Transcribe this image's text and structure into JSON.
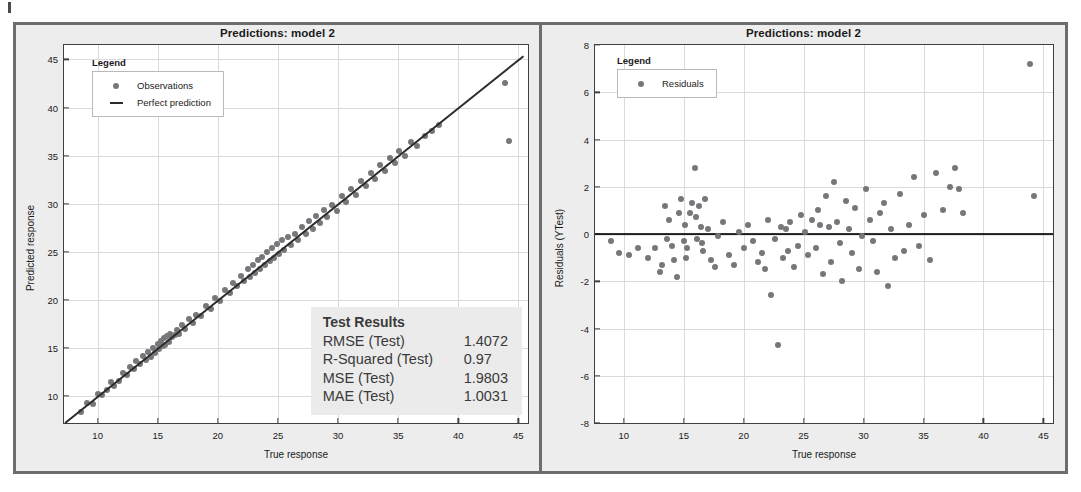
{
  "figure": {
    "left_panel": {
      "title": "Predictions: model 2",
      "xlabel": "True response",
      "ylabel": "Predicted response",
      "legend_title": "Legend",
      "legend_items": [
        {
          "label": "Observations",
          "marker": "dot"
        },
        {
          "label": "Perfect prediction",
          "marker": "line"
        }
      ],
      "results": {
        "title": "Test Results",
        "rows": [
          {
            "key": "RMSE (Test)",
            "value": "1.4072"
          },
          {
            "key": "R-Squared (Test)",
            "value": "0.97"
          },
          {
            "key": "MSE (Test)",
            "value": "1.9803"
          },
          {
            "key": "MAE (Test)",
            "value": "1.0031"
          }
        ]
      }
    },
    "right_panel": {
      "title": "Predictions: model 2",
      "xlabel": "True response",
      "ylabel": "Residuals (YTest)",
      "legend_title": "Legend",
      "legend_items": [
        {
          "label": "Residuals",
          "marker": "dot"
        }
      ]
    },
    "colors": {
      "marker": "#77777b",
      "reference_line": "#2b2b2b",
      "frame": "#6d6d6d",
      "panel_background": "#ededed",
      "plot_background": "#ffffff",
      "grid": "#dadada",
      "results_background": "#ebebeb"
    }
  },
  "chart_data": [
    {
      "type": "scatter",
      "title": "Predictions: model 2",
      "xlabel": "True response",
      "ylabel": "Predicted response",
      "xlim": [
        7.2,
        45.8
      ],
      "ylim": [
        7.2,
        46.5
      ],
      "xticks": [
        10,
        15,
        20,
        25,
        30,
        35,
        40,
        45
      ],
      "yticks": [
        10,
        15,
        20,
        25,
        30,
        35,
        40,
        45
      ],
      "grid": true,
      "legend_position": "top-left",
      "series": [
        {
          "name": "Observations",
          "marker": "circle",
          "color": "#77777b",
          "x": [
            8.6,
            9.1,
            9.6,
            10.0,
            10.4,
            10.8,
            11.1,
            11.4,
            11.8,
            12.1,
            12.4,
            12.7,
            13.0,
            13.2,
            13.5,
            13.8,
            14.0,
            14.2,
            14.4,
            14.6,
            14.8,
            15.0,
            15.1,
            15.3,
            15.4,
            15.5,
            15.6,
            15.8,
            15.9,
            16.0,
            16.2,
            16.4,
            16.6,
            16.8,
            17.0,
            17.3,
            17.6,
            17.9,
            18.2,
            18.6,
            19.0,
            19.4,
            19.8,
            20.2,
            20.6,
            21.0,
            21.3,
            21.6,
            21.9,
            22.2,
            22.5,
            22.7,
            22.9,
            23.1,
            23.3,
            23.5,
            23.7,
            23.9,
            24.1,
            24.3,
            24.5,
            24.7,
            24.9,
            25.1,
            25.3,
            25.5,
            25.8,
            26.1,
            26.4,
            26.7,
            27.0,
            27.3,
            27.6,
            27.9,
            28.2,
            28.5,
            28.8,
            29.1,
            29.5,
            29.9,
            30.3,
            30.7,
            31.1,
            31.5,
            31.9,
            32.3,
            32.7,
            33.1,
            33.5,
            33.9,
            34.3,
            34.7,
            35.1,
            35.6,
            36.1,
            36.6,
            37.2,
            37.8,
            38.4,
            43.9,
            44.2
          ],
          "y": [
            8.3,
            9.3,
            9.2,
            10.2,
            10.1,
            10.6,
            11.5,
            11.0,
            11.6,
            12.4,
            12.2,
            13.0,
            12.8,
            13.6,
            13.3,
            14.2,
            13.7,
            14.6,
            14.1,
            15.0,
            14.5,
            15.4,
            14.9,
            15.7,
            15.2,
            16.0,
            15.3,
            16.2,
            15.6,
            16.5,
            16.1,
            16.3,
            16.9,
            16.5,
            17.4,
            17.0,
            18.0,
            17.6,
            18.4,
            18.3,
            19.4,
            19.1,
            20.2,
            19.9,
            21.0,
            20.7,
            21.8,
            21.4,
            22.5,
            22.0,
            23.2,
            22.4,
            23.6,
            22.8,
            24.1,
            23.2,
            24.5,
            23.6,
            25.0,
            24.0,
            25.4,
            24.4,
            25.8,
            24.8,
            26.2,
            25.2,
            26.5,
            25.7,
            26.9,
            26.2,
            27.6,
            26.8,
            28.2,
            27.4,
            28.7,
            28.0,
            29.3,
            28.6,
            29.9,
            29.2,
            30.8,
            30.2,
            31.5,
            30.9,
            32.4,
            31.8,
            33.2,
            32.6,
            34.0,
            33.4,
            34.8,
            34.2,
            35.5,
            35.0,
            36.4,
            36.0,
            37.0,
            37.6,
            38.2,
            42.5,
            36.5
          ]
        },
        {
          "name": "Perfect prediction",
          "marker": "line",
          "color": "#2b2b2b",
          "x": [
            7.3,
            45.4
          ],
          "y": [
            7.3,
            45.4
          ]
        }
      ]
    },
    {
      "type": "scatter",
      "title": "Predictions: model 2",
      "xlabel": "True response",
      "ylabel": "Residuals (YTest)",
      "xlim": [
        7.6,
        45.8
      ],
      "ylim": [
        -8,
        8
      ],
      "xticks": [
        10,
        15,
        20,
        25,
        30,
        35,
        40,
        45
      ],
      "yticks": [
        -8,
        -6,
        -4,
        -2,
        0,
        2,
        4,
        6,
        8
      ],
      "grid": true,
      "legend_position": "top-left",
      "reference_line_y": 0,
      "series": [
        {
          "name": "Residuals",
          "marker": "circle",
          "color": "#77777b",
          "x": [
            8.9,
            9.6,
            10.4,
            11.2,
            12.0,
            12.6,
            13.0,
            13.2,
            13.4,
            13.6,
            13.8,
            14.0,
            14.2,
            14.4,
            14.6,
            14.8,
            15.0,
            15.1,
            15.2,
            15.3,
            15.5,
            15.7,
            15.9,
            16.0,
            16.1,
            16.3,
            16.4,
            16.5,
            16.6,
            16.8,
            17.0,
            17.3,
            17.6,
            17.9,
            18.3,
            18.8,
            19.2,
            19.6,
            20.0,
            20.4,
            20.8,
            21.2,
            21.5,
            21.8,
            22.0,
            22.3,
            22.6,
            22.9,
            23.1,
            23.3,
            23.5,
            23.7,
            23.9,
            24.2,
            24.5,
            24.8,
            25.1,
            25.4,
            25.7,
            26.0,
            26.2,
            26.4,
            26.6,
            26.9,
            27.1,
            27.3,
            27.5,
            27.8,
            28.0,
            28.2,
            28.5,
            28.8,
            29.0,
            29.3,
            29.6,
            29.9,
            30.2,
            30.5,
            30.8,
            31.1,
            31.4,
            31.7,
            32.0,
            32.3,
            32.6,
            33.0,
            33.4,
            33.8,
            34.2,
            34.6,
            35.0,
            35.5,
            36.0,
            36.6,
            37.2,
            37.6,
            38.0,
            38.3,
            43.9,
            44.2
          ],
          "y": [
            -0.3,
            -0.8,
            -0.9,
            -0.6,
            -1.0,
            -0.6,
            -1.6,
            -1.3,
            1.2,
            -0.2,
            0.6,
            -0.5,
            -1.1,
            -1.8,
            0.9,
            1.5,
            -0.3,
            0.4,
            -1.0,
            -0.6,
            0.9,
            1.3,
            2.8,
            0.7,
            -0.2,
            1.2,
            0.3,
            -0.4,
            -0.7,
            1.5,
            0.2,
            -1.1,
            -1.4,
            -0.1,
            0.5,
            -0.9,
            -1.3,
            0.1,
            -0.6,
            0.4,
            -0.3,
            -1.2,
            -0.8,
            -1.5,
            0.6,
            -2.6,
            -0.2,
            -4.7,
            0.3,
            -1.0,
            0.2,
            -0.7,
            0.5,
            -1.4,
            -0.5,
            0.8,
            0.1,
            -0.9,
            0.6,
            -0.6,
            1.0,
            0.4,
            -1.7,
            1.6,
            0.3,
            -1.2,
            2.2,
            0.5,
            -0.4,
            -2.0,
            1.4,
            0.2,
            -0.8,
            1.1,
            -1.5,
            -0.1,
            1.9,
            0.6,
            -0.3,
            -1.6,
            0.9,
            1.3,
            -2.2,
            0.2,
            -1.0,
            1.7,
            -0.7,
            0.4,
            2.4,
            -0.5,
            0.8,
            -1.1,
            2.6,
            1.0,
            2.0,
            2.8,
            1.9,
            0.9,
            7.2,
            1.6
          ]
        }
      ]
    }
  ]
}
